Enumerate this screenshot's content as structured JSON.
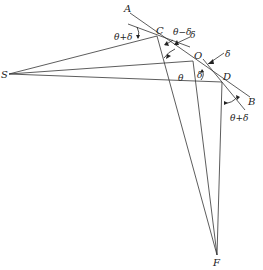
{
  "diagram": {
    "type": "geometric construction",
    "points": {
      "A": {
        "label": "A",
        "x": 130,
        "y": 13
      },
      "B": {
        "label": "B",
        "x": 250,
        "y": 97
      },
      "C": {
        "label": "C",
        "x": 157,
        "y": 36
      },
      "O": {
        "label": "O",
        "x": 193,
        "y": 61
      },
      "D": {
        "label": "D",
        "x": 222,
        "y": 82
      },
      "S": {
        "label": "S",
        "x": 9,
        "y": 74
      },
      "F": {
        "label": "F",
        "x": 217,
        "y": 255
      }
    },
    "labels": {
      "A": "A",
      "B": "B",
      "C": "C",
      "O": "O",
      "D": "D",
      "S": "S",
      "F": "F"
    },
    "angle_labels": {
      "theta_plus_delta_left": "θ+δ",
      "theta_minus_delta": "θ−δ",
      "delta_top": "δ",
      "delta_right": "δ",
      "delta_mid": "δ",
      "theta_mid": "θ",
      "theta_plus_delta_right": "θ+δ"
    },
    "segments": [
      [
        "A",
        "B"
      ],
      [
        "S",
        "C"
      ],
      [
        "S",
        "O"
      ],
      [
        "S",
        "D"
      ],
      [
        "C",
        "F"
      ],
      [
        "O",
        "F"
      ],
      [
        "D",
        "F"
      ]
    ]
  }
}
